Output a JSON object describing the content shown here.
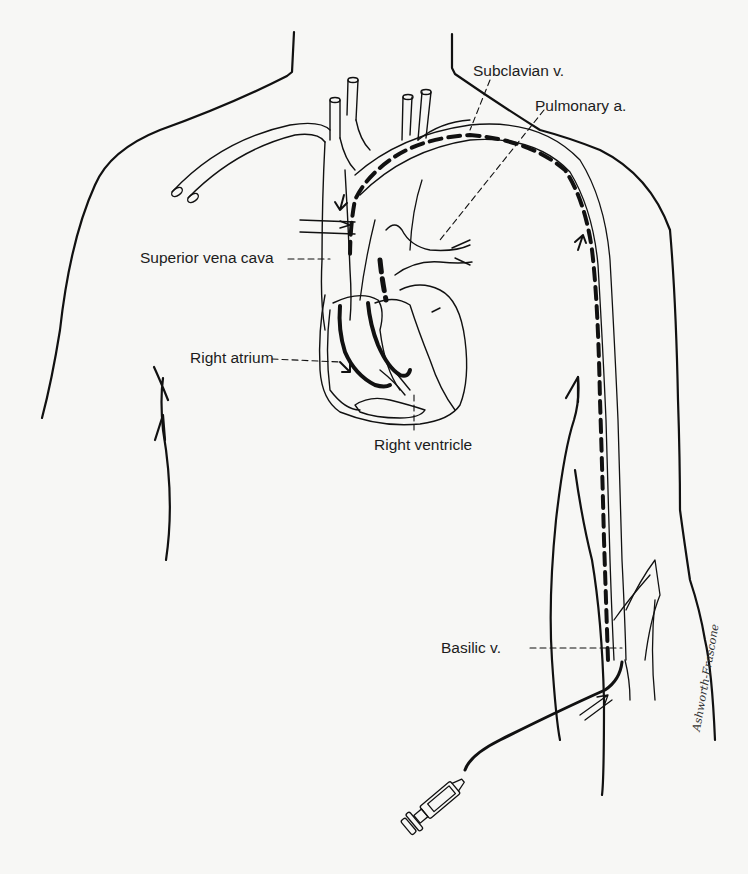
{
  "figure": {
    "type": "medical-illustration",
    "labels": [
      {
        "id": "subclavian",
        "text": "Subclavian v."
      },
      {
        "id": "pulmonary",
        "text": "Pulmonary a."
      },
      {
        "id": "svc",
        "text": "Superior vena cava"
      },
      {
        "id": "right-atrium",
        "text": "Right atrium"
      },
      {
        "id": "right-ventricle",
        "text": "Right ventricle"
      },
      {
        "id": "basilic",
        "text": "Basilic v."
      }
    ],
    "signature": "Ashworth-Frascone"
  },
  "colors": {
    "background": "#f7f7f5",
    "ink": "#111111"
  }
}
